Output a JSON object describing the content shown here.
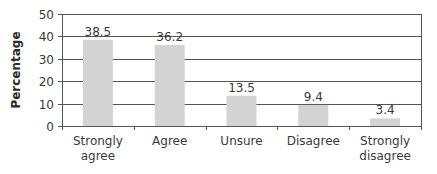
{
  "chart_data": {
    "type": "bar",
    "title": "",
    "xlabel": "",
    "ylabel": "Percentage",
    "ylim": [
      0,
      50
    ],
    "yticks": [
      0,
      10,
      20,
      30,
      40,
      50
    ],
    "grid": true,
    "categories": [
      [
        "Strongly",
        "agree"
      ],
      [
        "Agree"
      ],
      [
        "Unsure"
      ],
      [
        "Disagree"
      ],
      [
        "Strongly",
        "disagree"
      ]
    ],
    "values": [
      38.5,
      36.2,
      13.5,
      9.4,
      3.4
    ],
    "value_labels": [
      "38.5",
      "36.2",
      "13.5",
      "9.4",
      "3.4"
    ],
    "colors": {
      "bar": "#d3d3d3",
      "grid": "#555555",
      "axis": "#555555"
    }
  }
}
